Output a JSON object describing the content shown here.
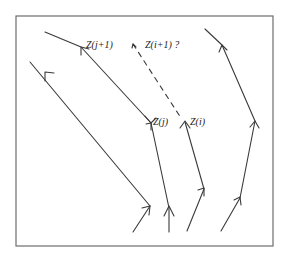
{
  "diagram": {
    "frame": {
      "x": 16,
      "y": 16,
      "width": 257,
      "height": 230,
      "color": "#6d6d6d"
    },
    "labels": {
      "z_j_plus_1": "Z(j+1)",
      "z_i_plus_1_question": "Z(i+1) ?",
      "z_j": "Z(j)",
      "z_i": "Z(i)"
    },
    "paths": [
      {
        "id": "path-a",
        "style": "solid",
        "points": [
          [
            30,
            62
          ],
          [
            150,
            206
          ],
          [
            133,
            232
          ]
        ]
      },
      {
        "id": "path-b",
        "style": "solid",
        "points": [
          [
            45,
            32
          ],
          [
            81,
            47
          ],
          [
            151,
            123
          ],
          [
            169,
            208
          ],
          [
            169,
            232
          ]
        ]
      },
      {
        "id": "path-c-dashed",
        "style": "dashed",
        "points": [
          [
            133,
            44
          ],
          [
            181,
            118
          ]
        ]
      },
      {
        "id": "path-c",
        "style": "solid",
        "points": [
          [
            185,
            122
          ],
          [
            204,
            189
          ],
          [
            187,
            231
          ]
        ]
      },
      {
        "id": "path-d",
        "style": "solid",
        "points": [
          [
            205,
            29
          ],
          [
            222,
            45
          ],
          [
            255,
            121
          ],
          [
            240,
            198
          ],
          [
            221,
            231
          ]
        ]
      }
    ],
    "line_color": "#3a3a3a"
  }
}
